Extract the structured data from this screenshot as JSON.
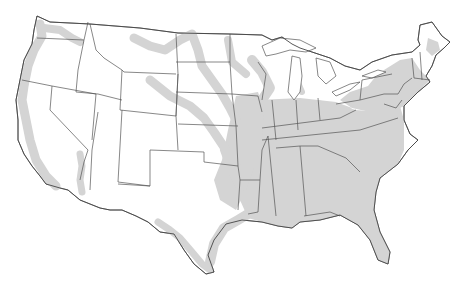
{
  "map": {
    "title": "United States map with shaded regions",
    "region": "Contiguous United States",
    "colors": {
      "background": "#ffffff",
      "land": "#ffffff",
      "shaded": "#d4d4d4",
      "borders": "#555555"
    },
    "shaded_areas": [
      "Pacific coast (WA, OR, CA)",
      "Colorado River corridor (AZ/CA border)",
      "Missouri River corridor (MT, ND, SD, NE)",
      "Mississippi River valley",
      "Great Plains rivers (KS, OK)",
      "Rio Grande / Texas border and Gulf coast",
      "Southeastern states (AR, LA, MS, AL, TN, GA, FL, SC)",
      "Ohio Valley (IL, IN, OH, KY)",
      "Mid-Atlantic and Northeast (PA, NY, NJ, New England)",
      "Upper Midwest (MN, WI, MI)"
    ]
  }
}
